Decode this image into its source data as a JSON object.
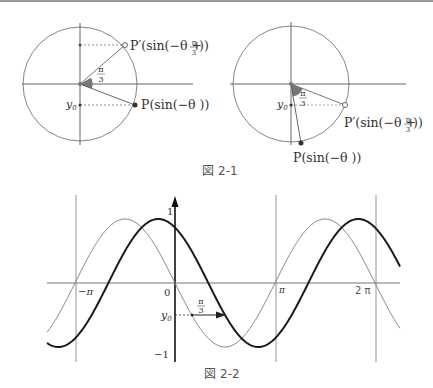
{
  "figure1": {
    "caption": "図 2-1",
    "left_circle": {
      "labels": {
        "p_prime": "P′(sin(−θ + ",
        "p_prime_close": " ))",
        "p": "P(sin(−θ ))",
        "y0": "y",
        "y0_sub": "0",
        "angle_num": "π",
        "angle_den": "3"
      }
    },
    "right_circle": {
      "labels": {
        "p_prime": "P′(sin(−θ + ",
        "p_prime_close": " ))",
        "p": "P(sin(−θ ))",
        "y0": "y",
        "y0_sub": "0",
        "angle_num": "π",
        "angle_den": "3"
      }
    },
    "frac_num": "π",
    "frac_den": "3"
  },
  "figure2": {
    "caption": "図 2-2",
    "axis_labels": {
      "y_max": "1",
      "y_min": "−1",
      "origin": "0",
      "neg_pi": "−π",
      "pi": "π",
      "two_pi": "2 π",
      "y0": "y",
      "y0_sub": "0",
      "shift_num": "π",
      "shift_den": "3"
    },
    "curves": [
      {
        "name": "y = sin(−x)",
        "style": "thin",
        "color": "#888888"
      },
      {
        "name": "y = sin(−x + π/3)",
        "style": "thick",
        "color": "#1a1a1a"
      }
    ]
  }
}
